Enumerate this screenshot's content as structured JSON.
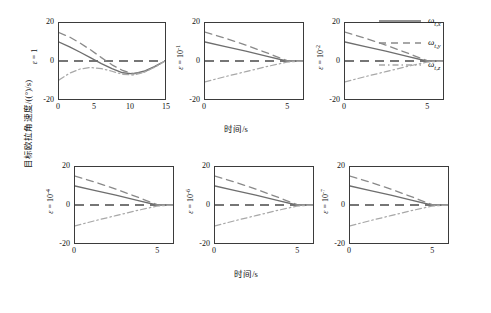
{
  "figure": {
    "ylabel": "目标欧拉角速度/((°)/s)",
    "xlabel_top": "时间/s",
    "xlabel_bottom": "时间/s"
  },
  "legend": {
    "position": "right-top",
    "entries": [
      {
        "name": "omega-t-x",
        "label": "ω",
        "sub": "t,x",
        "style": "solid",
        "color": "#6e6e6e"
      },
      {
        "name": "omega-t-y",
        "label": "ω",
        "sub": "t,y",
        "style": "dashed",
        "color": "#8a8a8a"
      },
      {
        "name": "omega-t-z",
        "label": "ω",
        "sub": "t,z",
        "style": "dashdot",
        "color": "#a8a8a8"
      }
    ]
  },
  "chart_data": [
    {
      "type": "line",
      "panel": 1,
      "annotation": "ε = 1",
      "eps_base": "1",
      "eps_exp": "",
      "xlabel": "时间/s",
      "ylabel": "目标欧拉角速度/((°)/s)",
      "xlim": [
        0,
        15
      ],
      "ylim": [
        -20,
        20
      ],
      "xticks": [
        0,
        5,
        10,
        15
      ],
      "yticks": [
        20,
        0,
        -20
      ],
      "grid": false,
      "series": [
        {
          "name": "ω_t,x",
          "style": "solid",
          "x": [
            0,
            1.5,
            3,
            4.5,
            6,
            7.5,
            9,
            10.5,
            12,
            13.5,
            15
          ],
          "y": [
            10.0,
            7.4,
            4.6,
            1.6,
            -1.4,
            -4.0,
            -6.2,
            -6.8,
            -5.4,
            -3.0,
            0.0
          ]
        },
        {
          "name": "ω_t,y",
          "style": "dashed",
          "x": [
            0,
            1.5,
            3,
            4.5,
            6,
            7.5,
            9,
            10.5,
            12,
            13.5,
            15
          ],
          "y": [
            15.0,
            12.6,
            9.4,
            5.8,
            1.8,
            -2.0,
            -5.0,
            -6.6,
            -5.8,
            -3.2,
            0.0
          ]
        },
        {
          "name": "ω_t,z",
          "style": "dashdot",
          "x": [
            0,
            1.5,
            3,
            4.5,
            6,
            7.5,
            9,
            10.5,
            12,
            13.5,
            15
          ],
          "y": [
            -10.0,
            -6.4,
            -4.2,
            -3.4,
            -4.0,
            -5.4,
            -7.0,
            -7.4,
            -6.0,
            -3.4,
            0.0
          ]
        }
      ]
    },
    {
      "type": "line",
      "panel": 2,
      "annotation": "ε = 10⁻¹",
      "eps_base": "10",
      "eps_exp": "-1",
      "xlabel": "时间/s",
      "xlim": [
        0,
        6
      ],
      "ylim": [
        -20,
        20
      ],
      "xticks": [
        0,
        5
      ],
      "yticks": [
        20,
        0,
        -20
      ],
      "grid": false,
      "series": [
        {
          "name": "ω_t,x",
          "style": "solid",
          "x": [
            0,
            1.25,
            2.5,
            3.75,
            5,
            6
          ],
          "y": [
            10.0,
            7.6,
            5.2,
            2.6,
            0.0,
            0.0
          ]
        },
        {
          "name": "ω_t,y",
          "style": "dashed",
          "x": [
            0,
            1.25,
            2.5,
            3.75,
            5,
            6
          ],
          "y": [
            15.2,
            12.0,
            8.4,
            4.4,
            0.3,
            0.0
          ]
        },
        {
          "name": "ω_t,z",
          "style": "dashdot",
          "x": [
            0,
            1.25,
            2.5,
            3.75,
            5,
            6
          ],
          "y": [
            -11.0,
            -8.2,
            -5.6,
            -3.0,
            -0.6,
            0.0
          ]
        }
      ]
    },
    {
      "type": "line",
      "panel": 3,
      "annotation": "ε = 10⁻²",
      "eps_base": "10",
      "eps_exp": "-2",
      "xlabel": "时间/s",
      "xlim": [
        0,
        6
      ],
      "ylim": [
        -20,
        20
      ],
      "xticks": [
        0,
        5
      ],
      "yticks": [
        20,
        0,
        -20
      ],
      "grid": false,
      "series": [
        {
          "name": "ω_t,x",
          "style": "solid",
          "x": [
            0,
            1.25,
            2.5,
            3.75,
            5,
            6
          ],
          "y": [
            10.0,
            7.6,
            5.2,
            2.6,
            0.0,
            0.0
          ]
        },
        {
          "name": "ω_t,y",
          "style": "dashed",
          "x": [
            0,
            1.25,
            2.5,
            3.75,
            5,
            6
          ],
          "y": [
            15.2,
            12.0,
            8.4,
            4.4,
            0.3,
            0.0
          ]
        },
        {
          "name": "ω_t,z",
          "style": "dashdot",
          "x": [
            0,
            1.25,
            2.5,
            3.75,
            5,
            6
          ],
          "y": [
            -11.0,
            -8.2,
            -5.6,
            -3.0,
            -0.6,
            0.0
          ]
        }
      ]
    },
    {
      "type": "line",
      "panel": 4,
      "annotation": "ε = 10⁻⁴",
      "eps_base": "10",
      "eps_exp": "-4",
      "xlabel": "时间/s",
      "xlim": [
        0,
        6
      ],
      "ylim": [
        -20,
        20
      ],
      "xticks": [
        0,
        5
      ],
      "yticks": [
        20,
        0,
        -20
      ],
      "grid": false,
      "series": [
        {
          "name": "ω_t,x",
          "style": "solid",
          "x": [
            0,
            1.25,
            2.5,
            3.75,
            5,
            6
          ],
          "y": [
            10.0,
            7.6,
            5.2,
            2.6,
            0.0,
            0.0
          ]
        },
        {
          "name": "ω_t,y",
          "style": "dashed",
          "x": [
            0,
            1.25,
            2.5,
            3.75,
            5,
            6
          ],
          "y": [
            15.2,
            12.0,
            8.4,
            4.4,
            0.3,
            0.0
          ]
        },
        {
          "name": "ω_t,z",
          "style": "dashdot",
          "x": [
            0,
            1.25,
            2.5,
            3.75,
            5,
            6
          ],
          "y": [
            -11.0,
            -8.2,
            -5.6,
            -3.0,
            -0.6,
            0.0
          ]
        }
      ]
    },
    {
      "type": "line",
      "panel": 5,
      "annotation": "ε = 10⁻⁶",
      "eps_base": "10",
      "eps_exp": "-6",
      "xlabel": "时间/s",
      "xlim": [
        0,
        6
      ],
      "ylim": [
        -20,
        20
      ],
      "xticks": [
        0,
        5
      ],
      "yticks": [
        20,
        0,
        -20
      ],
      "grid": false,
      "series": [
        {
          "name": "ω_t,x",
          "style": "solid",
          "x": [
            0,
            1.25,
            2.5,
            3.75,
            5,
            6
          ],
          "y": [
            10.0,
            7.6,
            5.2,
            2.6,
            0.0,
            0.0
          ]
        },
        {
          "name": "ω_t,y",
          "style": "dashed",
          "x": [
            0,
            1.25,
            2.5,
            3.75,
            5,
            6
          ],
          "y": [
            15.2,
            12.0,
            8.4,
            4.4,
            0.3,
            0.0
          ]
        },
        {
          "name": "ω_t,z",
          "style": "dashdot",
          "x": [
            0,
            1.25,
            2.5,
            3.75,
            5,
            6
          ],
          "y": [
            -11.0,
            -8.2,
            -5.6,
            -3.0,
            -0.6,
            0.0
          ]
        }
      ]
    },
    {
      "type": "line",
      "panel": 6,
      "annotation": "ε = 10⁻⁷",
      "eps_base": "10",
      "eps_exp": "-7",
      "xlabel": "时间/s",
      "xlim": [
        0,
        6
      ],
      "ylim": [
        -20,
        20
      ],
      "xticks": [
        0,
        5
      ],
      "yticks": [
        20,
        0,
        -20
      ],
      "grid": false,
      "series": [
        {
          "name": "ω_t,x",
          "style": "solid",
          "x": [
            0,
            1.25,
            2.5,
            3.75,
            5,
            6
          ],
          "y": [
            10.0,
            7.6,
            5.2,
            2.6,
            0.0,
            0.0
          ]
        },
        {
          "name": "ω_t,y",
          "style": "dashed",
          "x": [
            0,
            1.25,
            2.5,
            3.75,
            5,
            6
          ],
          "y": [
            15.2,
            12.0,
            8.4,
            4.4,
            0.3,
            0.0
          ]
        },
        {
          "name": "ω_t,z",
          "style": "dashdot",
          "x": [
            0,
            1.25,
            2.5,
            3.75,
            5,
            6
          ],
          "y": [
            -11.0,
            -8.2,
            -5.6,
            -3.0,
            -0.6,
            0.0
          ]
        }
      ]
    }
  ],
  "axis_text": {
    "y20": "20",
    "y0": "0",
    "ym20": "-20",
    "x0": "0",
    "x5": "5",
    "x10": "10",
    "x15": "15"
  },
  "epsilon_symbol": "ε",
  "equals": "="
}
